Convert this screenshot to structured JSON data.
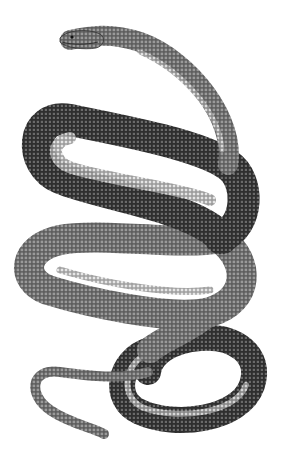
{
  "image": {
    "subject": "glass lizard / legless lizard engraving",
    "style": "monochrome scientific engraving",
    "background_color": "#ffffff",
    "body_dark": "#3a3a3a",
    "body_mid": "#6e6e6e",
    "body_light": "#bdbdbd",
    "belly_light": "#e6e6e6"
  }
}
